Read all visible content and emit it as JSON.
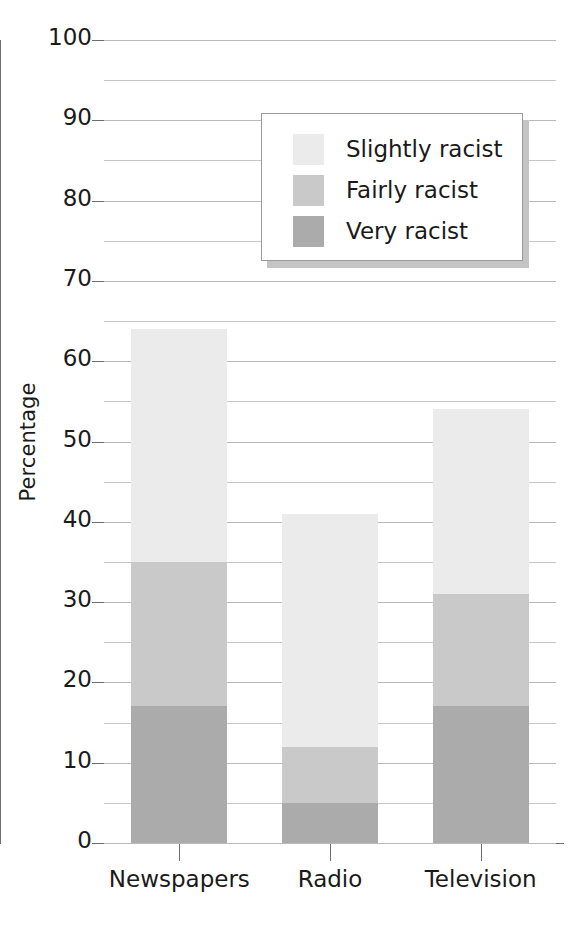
{
  "chart_data": {
    "type": "bar",
    "subtype": "stacked-bar",
    "title": "",
    "xlabel": "",
    "ylabel": "Percentage",
    "categories": [
      "Newspapers",
      "Radio",
      "Television"
    ],
    "series": [
      {
        "name": "Very racist",
        "color": "#ababab",
        "values": [
          17,
          5,
          17
        ]
      },
      {
        "name": "Fairly racist",
        "color": "#c9c9c9",
        "values": [
          18,
          7,
          14
        ]
      },
      {
        "name": "Slightly racist",
        "color": "#ebebeb",
        "values": [
          29,
          29,
          23
        ]
      }
    ],
    "totals": [
      64,
      41,
      54
    ],
    "ylim": [
      0,
      100
    ],
    "ytick_labels": [
      "0",
      "10",
      "20",
      "30",
      "40",
      "50",
      "60",
      "70",
      "80",
      "90",
      "100"
    ],
    "ytick_values": [
      0,
      10,
      20,
      30,
      40,
      50,
      60,
      70,
      80,
      90,
      100
    ],
    "gridline_values": [
      0,
      5,
      10,
      15,
      20,
      25,
      30,
      35,
      40,
      45,
      50,
      55,
      60,
      65,
      70,
      75,
      80,
      85,
      90,
      95,
      100
    ],
    "grid": true,
    "legend_position": "upper-center",
    "legend_entries": [
      "Slightly racist",
      "Fairly racist",
      "Very racist"
    ],
    "legend_colors": [
      "#ebebeb",
      "#c9c9c9",
      "#ababab"
    ]
  },
  "legend": {
    "items": [
      {
        "label": "Slightly racist",
        "color": "#ebebeb"
      },
      {
        "label": "Fairly racist",
        "color": "#c9c9c9"
      },
      {
        "label": "Very racist",
        "color": "#ababab"
      }
    ]
  },
  "axes": {
    "y_title": "Percentage"
  }
}
